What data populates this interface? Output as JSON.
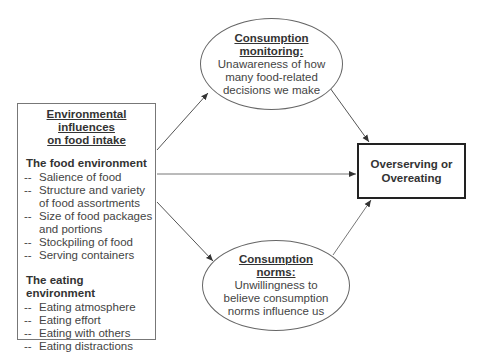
{
  "left_box": {
    "title_line1": "Environmental influences",
    "title_line2": "on food intake",
    "food_env": {
      "heading": "The food environment",
      "items": [
        "Salience of food",
        "Structure and variety of food assortments",
        "Size of food packages and portions",
        "Stockpiling of food",
        "Serving containers"
      ]
    },
    "eating_env": {
      "heading": "The eating environment",
      "items": [
        "Eating atmosphere",
        "Eating effort",
        "Eating with others",
        "Eating distractions"
      ]
    },
    "bullet": "--"
  },
  "top_ellipse": {
    "heading_line1": "Consumption",
    "heading_line2": "monitoring:",
    "body_line1": "Unawareness of how",
    "body_line2": "many food-related",
    "body_line3": "decisions we make"
  },
  "bottom_ellipse": {
    "heading_line1": "Consumption",
    "heading_line2": "norms:",
    "body_line1": "Unwillingness to",
    "body_line2": "believe consumption",
    "body_line3": "norms influence us"
  },
  "outcome_box": {
    "line1": "Overserving or",
    "line2": "Overeating"
  },
  "colors": {
    "line": "#555555",
    "outcome_border": "#222222"
  }
}
